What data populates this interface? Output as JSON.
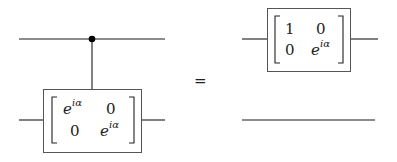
{
  "diagram": {
    "type": "quantum-circuit-identity",
    "lhs": {
      "control_qubit": "control dot on top wire",
      "gate_matrix": [
        [
          "e^{iα}",
          "0"
        ],
        [
          "0",
          "e^{iα}"
        ]
      ],
      "cells": {
        "a11_base": "e",
        "a11_sup": "iα",
        "a12": "0",
        "a21": "0",
        "a22_base": "e",
        "a22_sup": "iα"
      }
    },
    "equals": "=",
    "rhs": {
      "gate_matrix": [
        [
          "1",
          "0"
        ],
        [
          "0",
          "e^{iα}"
        ]
      ],
      "cells": {
        "a11": "1",
        "a12": "0",
        "a21": "0",
        "a22_base": "e",
        "a22_sup": "iα"
      },
      "bottom_wire": "identity (no gate)"
    }
  }
}
